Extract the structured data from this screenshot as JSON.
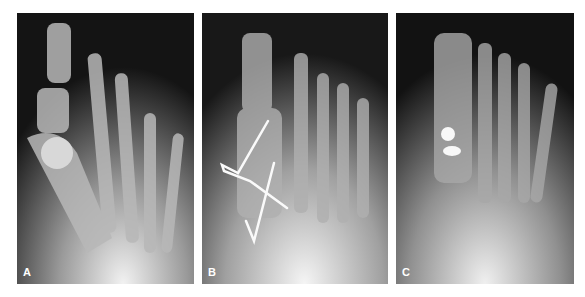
{
  "figure": {
    "panels": [
      {
        "label": "A",
        "description": "AP foot radiograph, hallux with first metatarsal head lesion"
      },
      {
        "label": "B",
        "description": "AP foot radiograph with crossed K-wire fixation of first metatarsal"
      },
      {
        "label": "C",
        "description": "AP foot radiograph with two screws in first metatarsal"
      }
    ]
  }
}
